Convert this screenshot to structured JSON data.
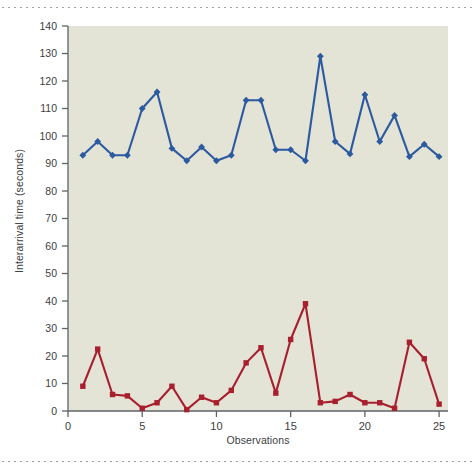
{
  "chart_data": {
    "type": "line",
    "title": "",
    "xlabel": "Observations",
    "ylabel": "Interarrival time (seconds)",
    "xlim": [
      0,
      25.6
    ],
    "ylim": [
      0,
      140
    ],
    "xticks": [
      0,
      5,
      10,
      15,
      20,
      25
    ],
    "yticks": [
      0,
      10,
      20,
      30,
      40,
      50,
      60,
      70,
      80,
      90,
      100,
      110,
      120,
      130,
      140
    ],
    "grid": false,
    "legend": "none",
    "plot_background": "#e3e3d6",
    "x": [
      1,
      2,
      3,
      4,
      5,
      6,
      7,
      8,
      9,
      10,
      11,
      12,
      13,
      14,
      15,
      16,
      17,
      18,
      19,
      20,
      21,
      22,
      23,
      24,
      25
    ],
    "series": [
      {
        "name": "blue-series",
        "color": "#2c5aa0",
        "marker": "diamond",
        "values": [
          93,
          98,
          93,
          93,
          110,
          116,
          95.5,
          91,
          96,
          91,
          93,
          113,
          113,
          95,
          95,
          91,
          129,
          98,
          93.5,
          115,
          98,
          107.5,
          92.5,
          97,
          92.5
        ]
      },
      {
        "name": "red-series",
        "color": "#a81f2e",
        "marker": "square",
        "values": [
          9,
          22.5,
          6,
          5.5,
          1,
          3,
          9,
          0.5,
          5,
          3,
          7.5,
          17.5,
          23,
          6.5,
          26,
          39,
          3,
          3.5,
          6,
          3,
          3,
          1,
          25,
          19,
          2.5
        ]
      }
    ]
  },
  "axis_tick_label_color": "#3c4043",
  "frame": {
    "top_rule": "dotted-rule",
    "bottom_rule": "dotted-rule"
  }
}
